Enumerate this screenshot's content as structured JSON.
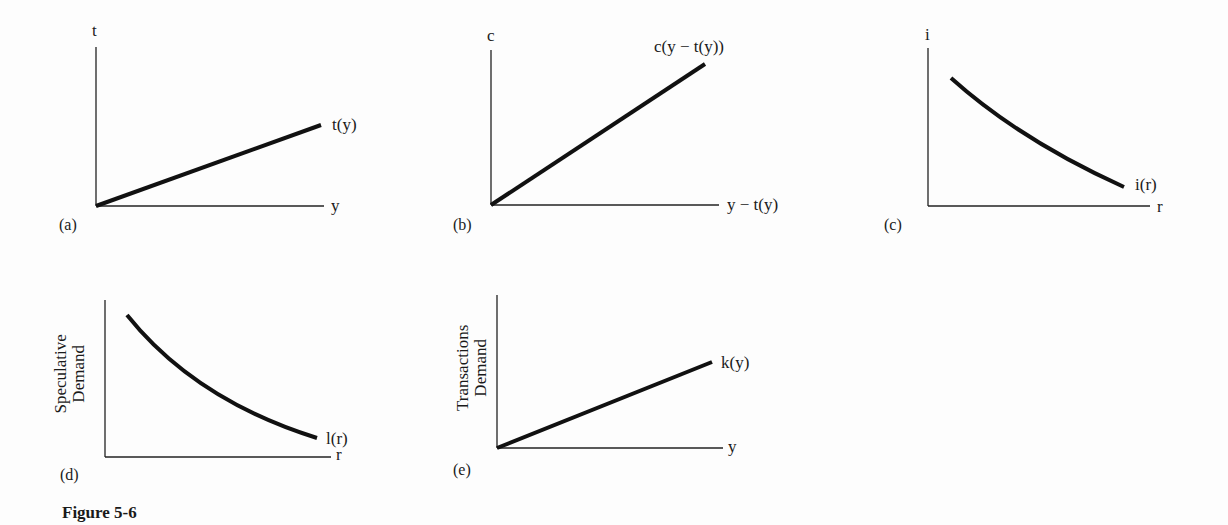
{
  "figure": {
    "caption": "Figure 5-6",
    "panels": [
      {
        "id": "a",
        "panel_label": "(a)",
        "y_axis_label": "t",
        "x_axis_label": "y",
        "curve_label": "t(y)",
        "shape": "increasing-linear"
      },
      {
        "id": "b",
        "panel_label": "(b)",
        "y_axis_label": "c",
        "x_axis_label": "y − t(y)",
        "curve_label": "c(y − t(y))",
        "shape": "increasing-linear"
      },
      {
        "id": "c",
        "panel_label": "(c)",
        "y_axis_label": "i",
        "x_axis_label": "r",
        "curve_label": "i(r)",
        "shape": "decreasing-convex"
      },
      {
        "id": "d",
        "panel_label": "(d)",
        "y_axis_label_line1": "Speculative",
        "y_axis_label_line2": "Demand",
        "x_axis_label": "r",
        "curve_label": "l(r)",
        "shape": "decreasing-convex"
      },
      {
        "id": "e",
        "panel_label": "(e)",
        "y_axis_label_line1": "Transactions",
        "y_axis_label_line2": "Demand",
        "x_axis_label": "y",
        "curve_label": "k(y)",
        "shape": "increasing-linear"
      }
    ]
  },
  "colors": {
    "ink": "#1a1a1a",
    "paper": "#fdfdfd"
  }
}
